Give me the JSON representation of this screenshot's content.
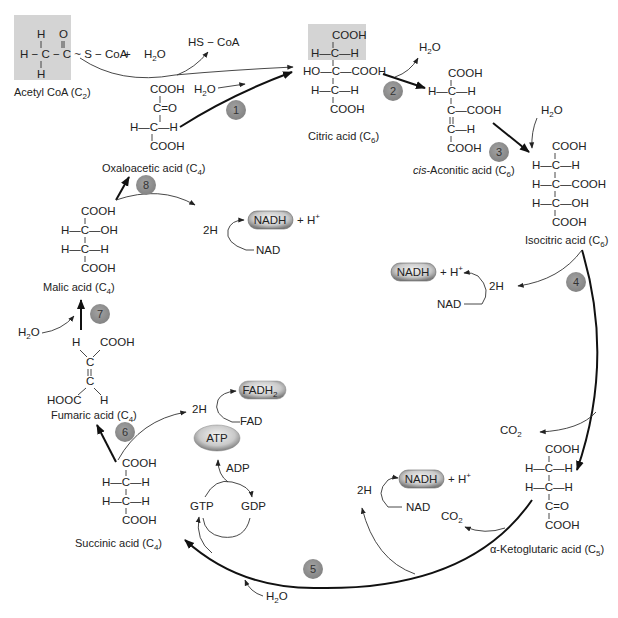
{
  "diagram": {
    "colors": {
      "step_circle": "#8c8c8c",
      "highlight_box": "#d4d4d4",
      "pill_fill": "#bcbcbc",
      "arrow": "#111111"
    },
    "compounds": {
      "acetyl_coa": {
        "name": "Acetyl CoA",
        "carbons": "2",
        "structure": [
          "H  O",
          "H—C—C~S—CoA",
          "H"
        ]
      },
      "citric": {
        "name": "Citric acid",
        "carbons": "6",
        "rows": [
          "COOH",
          "H—C—H",
          "HO—C—COOH",
          "H—C—H",
          "COOH"
        ]
      },
      "cis_aconitic": {
        "name_prefix": "cis",
        "name": "-Aconitic acid",
        "carbons": "6",
        "rows": [
          "COOH",
          "H—C—H",
          "C—COOH",
          "C—H",
          "COOH"
        ]
      },
      "isocitric": {
        "name": "Isocitric acid",
        "carbons": "6",
        "rows": [
          "COOH",
          "H—C—H",
          "H—C—COOH",
          "H—C—OH",
          "COOH"
        ]
      },
      "alpha_ketoglutaric": {
        "name": "α-Ketoglutaric acid",
        "carbons": "5",
        "rows": [
          "COOH",
          "H—C—H",
          "H—C—H",
          "C=O",
          "COOH"
        ]
      },
      "succinic": {
        "name": "Succinic acid",
        "carbons": "4",
        "rows": [
          "COOH",
          "H—C—H",
          "H—C—H",
          "COOH"
        ]
      },
      "fumaric": {
        "name": "Fumaric acid",
        "carbons": "4",
        "rows": [
          "H",
          "COOH",
          "C",
          "C",
          "HOOC",
          "H"
        ]
      },
      "malic": {
        "name": "Malic acid",
        "carbons": "4",
        "rows": [
          "COOH",
          "H—C—OH",
          "H—C—H",
          "COOH"
        ]
      },
      "oxaloacetic": {
        "name": "Oxaloacetic acid",
        "carbons": "4",
        "rows": [
          "COOH",
          "C=O",
          "H—C—H",
          "COOH"
        ]
      }
    },
    "reagents": {
      "plus": "+",
      "water": "H",
      "water_sub": "2",
      "water_o": "O",
      "hs_coa": "HS − CoA",
      "two_h": "2H",
      "nad": "NAD",
      "nadh": "NADH",
      "h_plus": "+ H",
      "plus_sup": "+",
      "fad": "FAD",
      "fadh2": "FADH",
      "fadh2_sub": "2",
      "atp": "ATP",
      "adp": "ADP",
      "gtp": "GTP",
      "gdp": "GDP",
      "co2": "CO",
      "co2_sub": "2"
    },
    "steps": [
      "1",
      "2",
      "3",
      "4",
      "5",
      "6",
      "7",
      "8"
    ]
  }
}
